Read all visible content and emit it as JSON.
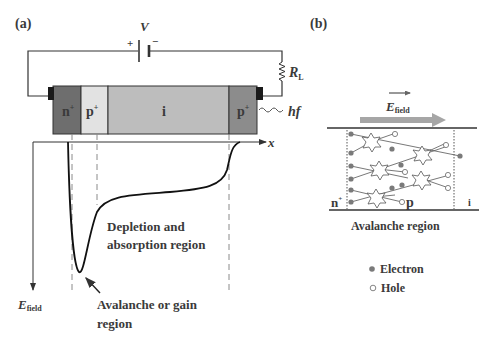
{
  "panel_a": {
    "label": "(a)",
    "circuit": {
      "voltage_label": "V",
      "plus_sign": "+",
      "minus_sign": "−",
      "resistor_label": "R",
      "resistor_sub": "L"
    },
    "layers": [
      {
        "name": "n-plus",
        "label": "n",
        "sup": "+",
        "color": "#6e6e6e"
      },
      {
        "name": "p",
        "label": "p",
        "sup": "+",
        "color": "#e2e2e2"
      },
      {
        "name": "i",
        "label": "i",
        "sup": "",
        "color": "#bdbdbd"
      },
      {
        "name": "p-plus",
        "label": "p",
        "sup": "+",
        "color": "#8c8c8c"
      }
    ],
    "light_label": "hf",
    "x_axis_label": "x",
    "y_axis_label": "E",
    "y_axis_sub": "field",
    "depletion_label_line1": "Depletion and",
    "depletion_label_line2": "absorption region",
    "avalanche_label_line1": "Avalanche or gain",
    "avalanche_label_line2": "region"
  },
  "panel_b": {
    "label": "(b)",
    "field_label": "E",
    "field_sub": "field",
    "n_label": "n",
    "n_sup": "+",
    "p_label": "p",
    "i_label": "i",
    "region_caption": "Avalanche region",
    "legend": [
      {
        "symbol": "filled-circle",
        "label": "Electron"
      },
      {
        "symbol": "open-circle",
        "label": "Hole"
      }
    ]
  },
  "colors": {
    "line": "#333333",
    "dashed": "#8a8a8a",
    "particle": "#7a7a7a",
    "arrow_field": "#a6a6a6"
  }
}
